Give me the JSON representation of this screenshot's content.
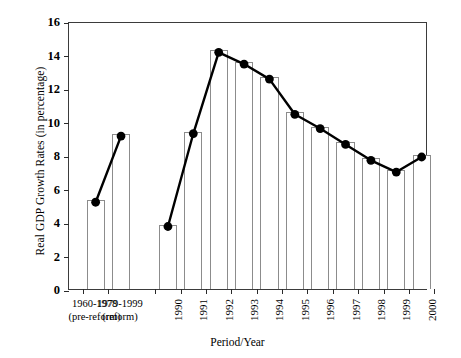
{
  "chart_data": {
    "type": "bar",
    "title": "",
    "xlabel": "Period/Year",
    "ylabel": "Real GDP Growth Rates (in percentage)",
    "ylim": [
      0,
      16
    ],
    "ytick_step": 2,
    "ytick_labels": [
      "0",
      "2",
      "4",
      "6",
      "8",
      "10",
      "12",
      "14",
      "16"
    ],
    "grid": false,
    "legend": false,
    "categories": [
      "1960-1978 (pre-reform)",
      "1979-1999 (reform)",
      "1990",
      "1991",
      "1992",
      "1993",
      "1994",
      "1995",
      "1996",
      "1997",
      "1998",
      "1999",
      "2000"
    ],
    "category_labels": [
      {
        "line1": "1960-1978",
        "line2": "(pre-reform)",
        "orientation": "horizontal"
      },
      {
        "line1": "1979-1999",
        "line2": "(reform)",
        "orientation": "horizontal"
      },
      {
        "line1": "1990",
        "line2": "",
        "orientation": "vertical"
      },
      {
        "line1": "1991",
        "line2": "",
        "orientation": "vertical"
      },
      {
        "line1": "1992",
        "line2": "",
        "orientation": "vertical"
      },
      {
        "line1": "1993",
        "line2": "",
        "orientation": "vertical"
      },
      {
        "line1": "1994",
        "line2": "",
        "orientation": "vertical"
      },
      {
        "line1": "1995",
        "line2": "",
        "orientation": "vertical"
      },
      {
        "line1": "1996",
        "line2": "",
        "orientation": "vertical"
      },
      {
        "line1": "1997",
        "line2": "",
        "orientation": "vertical"
      },
      {
        "line1": "1998",
        "line2": "",
        "orientation": "vertical"
      },
      {
        "line1": "1999",
        "line2": "",
        "orientation": "vertical"
      },
      {
        "line1": "2000",
        "line2": "",
        "orientation": "vertical"
      }
    ],
    "values": [
      5.3,
      9.25,
      3.85,
      9.4,
      14.25,
      13.55,
      12.65,
      10.55,
      9.7,
      8.75,
      7.8,
      7.1,
      8.0
    ],
    "series": [
      {
        "name": "Real GDP Growth Rate",
        "render": "bar+line-markers",
        "values": [
          5.3,
          9.25,
          3.85,
          9.4,
          14.25,
          13.55,
          12.65,
          10.55,
          9.7,
          8.75,
          7.8,
          7.1,
          8.0
        ]
      }
    ],
    "line_breaks_after_index": 1,
    "colors": {
      "bar_fill": "#ffffff",
      "bar_edge": "#8c8c8c",
      "line": "#000000",
      "marker": "#000000",
      "axis": "#2a2a2a",
      "background": "#ffffff",
      "text": "#000000"
    }
  }
}
